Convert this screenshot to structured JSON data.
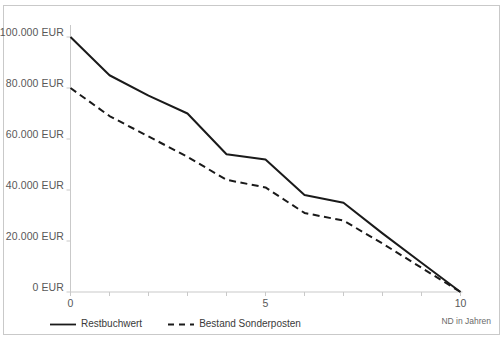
{
  "figure": {
    "top_text_fragment": "",
    "background_color": "#ffffff",
    "frame_color": "#c9c9c9"
  },
  "chart_data": {
    "type": "line",
    "title": "",
    "subtitle": "",
    "xlabel": "ND in Jahren",
    "ylabel": "",
    "x": [
      0,
      1,
      2,
      3,
      4,
      5,
      6,
      7,
      8,
      9,
      10
    ],
    "xlim": [
      0,
      10
    ],
    "ylim": [
      0,
      100000
    ],
    "xticks": [
      0,
      1,
      2,
      3,
      4,
      5,
      6,
      7,
      8,
      9,
      10
    ],
    "xtick_labels": [
      "0",
      "",
      "",
      "",
      "",
      "5",
      "",
      "",
      "",
      "",
      "10"
    ],
    "yticks": [
      0,
      20000,
      40000,
      60000,
      80000,
      100000
    ],
    "ytick_labels": [
      "0 EUR",
      "20.000 EUR",
      "40.000 EUR",
      "60.000 EUR",
      "80.000 EUR",
      "100.000 EUR"
    ],
    "grid": false,
    "legend_position": "bottom-left",
    "series": [
      {
        "name": "Restbuchwert",
        "style": "solid",
        "color": "#1a1a1a",
        "values": [
          100000,
          85000,
          77000,
          70000,
          54000,
          52000,
          38000,
          35000,
          23000,
          11500,
          0
        ]
      },
      {
        "name": "Bestand Sonderposten",
        "style": "dashed",
        "color": "#1a1a1a",
        "values": [
          80000,
          69000,
          61000,
          53000,
          44000,
          41000,
          31000,
          28000,
          19000,
          9500,
          0
        ]
      }
    ]
  },
  "legend": {
    "items": [
      {
        "label": "Restbuchwert",
        "style": "solid"
      },
      {
        "label": "Bestand Sonderposten",
        "style": "dashed"
      }
    ]
  }
}
